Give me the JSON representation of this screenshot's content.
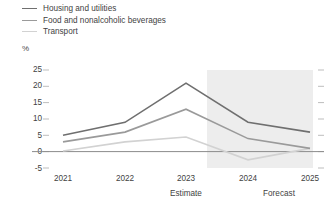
{
  "legend": {
    "items": [
      {
        "label": "Housing and utilities",
        "color": "#6f6f6f"
      },
      {
        "label": "Food and nonalcoholic beverages",
        "color": "#9a9a9a"
      },
      {
        "label": "Transport",
        "color": "#d2d2d2"
      }
    ]
  },
  "axis": {
    "unit": "%",
    "y_ticks": [
      "25",
      "20",
      "15",
      "10",
      "5",
      "0",
      "-5"
    ],
    "x_ticks": [
      "2021",
      "2022",
      "2023",
      "2024",
      "2025"
    ],
    "notes": [
      {
        "text": "Estimate"
      },
      {
        "text": "Forecast"
      }
    ]
  },
  "colors": {
    "forecast_band": "#ededed",
    "zero_line": "#8c8c8c",
    "tick": "#bdbdbd",
    "text": "#3f3f3f"
  },
  "chart_data": {
    "type": "line",
    "title": "",
    "subtitle": "",
    "xlabel": "",
    "ylabel": "%",
    "ylim": [
      -5,
      25
    ],
    "yticks": [
      -5,
      0,
      5,
      10,
      15,
      20,
      25
    ],
    "grid": false,
    "legend_position": "top-left",
    "categories": [
      "2021",
      "2022",
      "2023",
      "2024",
      "2025"
    ],
    "series": [
      {
        "name": "Housing and utilities",
        "color": "#6f6f6f",
        "values": [
          5,
          9,
          21,
          9,
          6
        ]
      },
      {
        "name": "Food and nonalcoholic beverages",
        "color": "#9a9a9a",
        "values": [
          3,
          6,
          13,
          4,
          1
        ]
      },
      {
        "name": "Transport",
        "color": "#d2d2d2",
        "values": [
          0.2,
          3,
          4.5,
          -2.5,
          1
        ]
      }
    ],
    "annotations": [
      {
        "text": "Estimate",
        "x": "2023"
      },
      {
        "text": "Forecast",
        "x": "2024-2025"
      }
    ],
    "shaded_region": {
      "from": "2023.5",
      "to": "2025",
      "label": "Forecast",
      "color": "#ededed"
    }
  }
}
